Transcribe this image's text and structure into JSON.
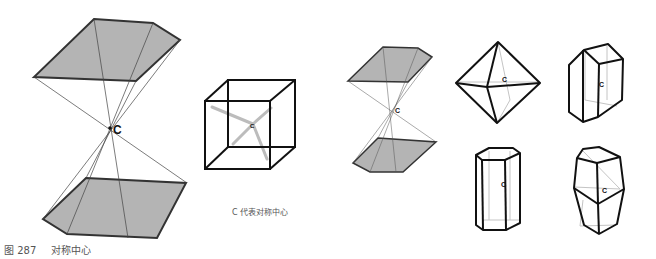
{
  "figure": {
    "number_label": "图 287",
    "title": "对称中心",
    "legend_text": "C 代表对称中心",
    "center_label": "C"
  },
  "colors": {
    "face_fill": "#b4b4b4",
    "edge": "#222222",
    "hidden_edge": "#bdbdbd",
    "caption_text": "#555555"
  }
}
